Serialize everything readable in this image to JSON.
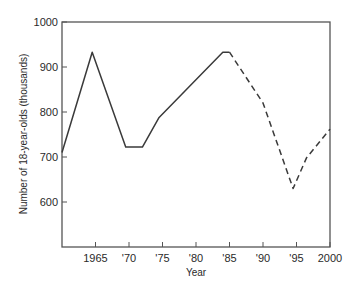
{
  "chart_data": {
    "type": "line",
    "title": "",
    "xlabel": "Year",
    "ylabel": "Number of 18-year-olds (thousands)",
    "xlim": [
      1960,
      2000
    ],
    "ylim": [
      500,
      1000
    ],
    "grid": false,
    "legend": null,
    "x_ticks": [
      1965,
      1970,
      1975,
      1980,
      1985,
      1990,
      1995,
      2000
    ],
    "x_tick_labels": [
      "1965",
      "'70",
      "'75",
      "'80",
      "'85",
      "'90",
      "'95",
      "2000"
    ],
    "y_ticks": [
      600,
      700,
      800,
      900,
      1000
    ],
    "y_tick_labels": [
      "600",
      "700",
      "800",
      "900",
      "1000"
    ],
    "series": [
      {
        "name": "Actual",
        "style": "solid",
        "x": [
          1960,
          1964.5,
          1969.5,
          1972,
          1974.5,
          1984,
          1985
        ],
        "y": [
          710,
          933,
          722,
          722,
          788,
          933,
          933
        ]
      },
      {
        "name": "Projected",
        "style": "dashed",
        "x": [
          1985,
          1990,
          1994.5,
          1996.5,
          2000
        ],
        "y": [
          933,
          820,
          630,
          698,
          762
        ]
      }
    ]
  }
}
